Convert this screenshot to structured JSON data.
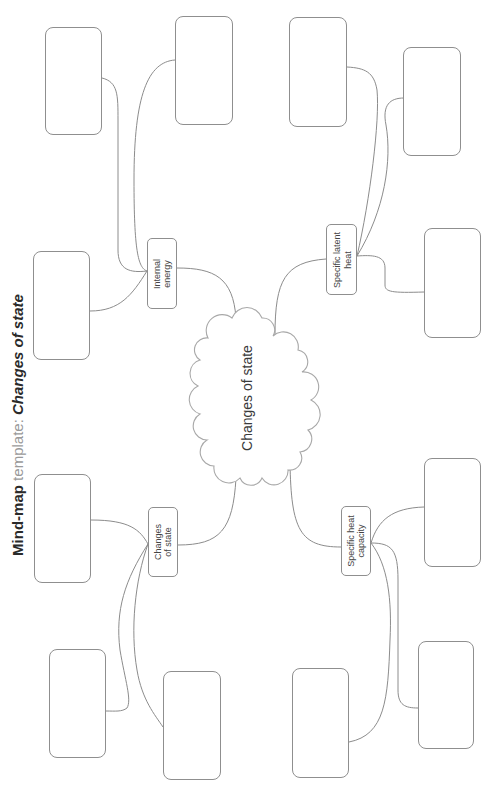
{
  "title": {
    "prefix": "Mind-map ",
    "middle": "template: ",
    "subject": "Changes of state"
  },
  "central_topic": {
    "label": "Changes of state"
  },
  "branches": {
    "internal_energy": {
      "lines": [
        "Internal",
        "energy"
      ]
    },
    "changes_of_state": {
      "lines": [
        "Changes",
        "of state"
      ]
    },
    "specific_latent_heat": {
      "lines": [
        "Specific latent",
        "heat"
      ]
    },
    "specific_heat_capacity": {
      "lines": [
        "Specific heat",
        "capacity"
      ]
    }
  },
  "answer_boxes_per_branch": 3,
  "colors": {
    "connector": "#8c8c8c",
    "box_border": "#8f8f8f",
    "text": "#333333",
    "title_light": "#9a9a9a",
    "background": "#ffffff"
  }
}
